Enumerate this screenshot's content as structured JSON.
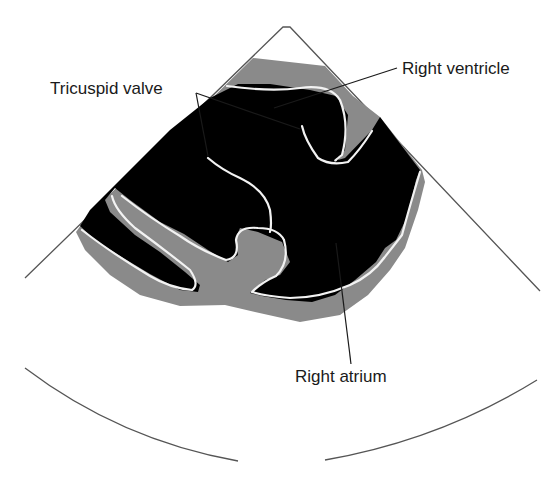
{
  "diagram": {
    "type": "echocardiogram-schematic",
    "view": "apical-sector",
    "colors": {
      "background": "#ffffff",
      "cavity": "#000000",
      "tissue": "#8a8a8a",
      "endocardial_border": "#f2f2f2",
      "sector_outline": "#555555",
      "leader_line": "#1a1a1a"
    },
    "labels": [
      {
        "id": "tricuspid_valve",
        "text": "Tricuspid valve"
      },
      {
        "id": "right_ventricle",
        "text": "Right ventricle"
      },
      {
        "id": "right_atrium",
        "text": "Right atrium"
      }
    ]
  }
}
